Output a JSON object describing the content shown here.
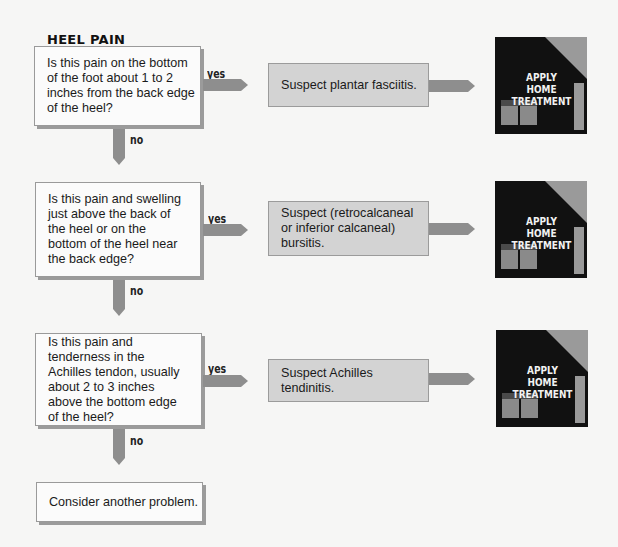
{
  "title": "HEEL PAIN",
  "colors": {
    "background": "#f6f6f5",
    "question_fill": "#fbfbfb",
    "suspect_fill": "#d3d3d3",
    "arrow": "#8e8e8e",
    "house": "#111111",
    "house_accent": "#9a9a9a"
  },
  "steps": [
    {
      "question": "Is this pain on the bottom of the foot about 1 to 2 inches from the back edge of the heel?",
      "yes_label": "yes",
      "no_label": "no",
      "suspect": "Suspect plantar fasciitis.",
      "action": "APPLY HOME TREATMENT",
      "action_lines": [
        "APPLY",
        "HOME",
        "TREATMENT"
      ]
    },
    {
      "question": "Is this pain and swelling just above the back of the heel or on the bottom of the heel near the back edge?",
      "yes_label": "yes",
      "no_label": "no",
      "suspect": "Suspect (retrocalcaneal or inferior calcaneal) bursitis.",
      "action": "APPLY HOME TREATMENT",
      "action_lines": [
        "APPLY",
        "HOME",
        "TREATMENT"
      ]
    },
    {
      "question": "Is this pain and tenderness in the Achilles tendon, usually about 2 to 3 inches above the bottom edge of the heel?",
      "yes_label": "yes",
      "no_label": "no",
      "suspect": "Suspect Achilles tendinitis.",
      "action": "APPLY HOME TREATMENT",
      "action_lines": [
        "APPLY",
        "HOME",
        "TREATMENT"
      ]
    }
  ],
  "final": "Consider another problem."
}
